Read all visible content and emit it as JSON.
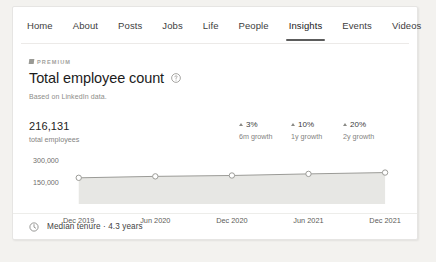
{
  "nav": {
    "tabs": [
      {
        "label": "Home",
        "active": false
      },
      {
        "label": "About",
        "active": false
      },
      {
        "label": "Posts",
        "active": false
      },
      {
        "label": "Jobs",
        "active": false
      },
      {
        "label": "Life",
        "active": false
      },
      {
        "label": "People",
        "active": false
      },
      {
        "label": "Insights",
        "active": true
      },
      {
        "label": "Events",
        "active": false
      },
      {
        "label": "Videos",
        "active": false
      }
    ]
  },
  "premium": {
    "label": "PREMIUM",
    "icon": "premium-badge-icon"
  },
  "header": {
    "title": "Total employee count",
    "info_icon": "info-circle-icon",
    "subtitle": "Based on LinkedIn data."
  },
  "stats": {
    "main": {
      "value": "216,131",
      "label": "total employees"
    },
    "growth": [
      {
        "value": "3%",
        "label": "6m growth",
        "direction": "up"
      },
      {
        "value": "10%",
        "label": "1y growth",
        "direction": "up"
      },
      {
        "value": "20%",
        "label": "2y growth",
        "direction": "up"
      }
    ]
  },
  "footer": {
    "icon": "clock-icon",
    "text": "Median tenure · 4.3 years"
  },
  "colors": {
    "page_background": "#f3f2ef",
    "card_background": "#ffffff",
    "line": "#9b9b97",
    "area_fill": "#e7e7e4",
    "active_tab_underline": "#5c5c5c",
    "text_primary": "#1c1c1c",
    "text_muted": "#84837f"
  },
  "chart_data": {
    "type": "area",
    "title": "Total employee count",
    "xlabel": "",
    "ylabel": "",
    "categories": [
      "Dec 2019",
      "Jun 2020",
      "Dec 2020",
      "Jun 2021",
      "Dec 2021"
    ],
    "values": [
      180000,
      190000,
      196000,
      207000,
      216131
    ],
    "ytick_labels": [
      "300,000",
      "150,000"
    ],
    "ytick_values": [
      300000,
      150000
    ],
    "ylim": [
      0,
      330000
    ],
    "grid": false,
    "legend": false,
    "marker": "open-circle",
    "series": [
      {
        "name": "Total employees",
        "values": [
          180000,
          190000,
          196000,
          207000,
          216131
        ]
      }
    ]
  }
}
